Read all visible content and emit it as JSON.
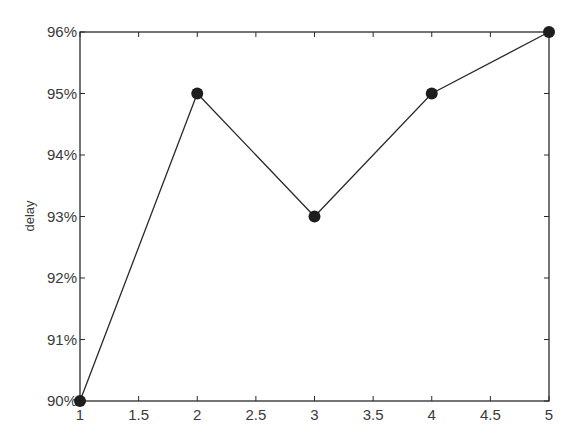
{
  "chart_data": {
    "type": "line",
    "title": "",
    "xlabel": "",
    "ylabel": "delay",
    "x": [
      1,
      2,
      3,
      4,
      5
    ],
    "series": [
      {
        "name": "delay",
        "values": [
          90,
          95,
          93,
          95,
          96
        ],
        "marker": "filled-circle",
        "color": "#1e1e1e"
      }
    ],
    "xlim": [
      1,
      5
    ],
    "ylim": [
      90,
      96
    ],
    "xticks": [
      1,
      1.5,
      2,
      2.5,
      3,
      3.5,
      4,
      4.5,
      5
    ],
    "xtick_labels": [
      "1",
      "1.5",
      "2",
      "2.5",
      "3",
      "3.5",
      "4",
      "4.5",
      "5"
    ],
    "yticks": [
      90,
      91,
      92,
      93,
      94,
      95,
      96
    ],
    "ytick_labels": [
      "90%",
      "91%",
      "92%",
      "93%",
      "94%",
      "95%",
      "96%"
    ],
    "grid": false,
    "legend": null,
    "box": true
  },
  "colors": {
    "axis": "#2a2a2a",
    "line": "#2a2a2a",
    "marker": "#1e1e1e",
    "text": "#3a3a3a",
    "background": "#ffffff"
  }
}
